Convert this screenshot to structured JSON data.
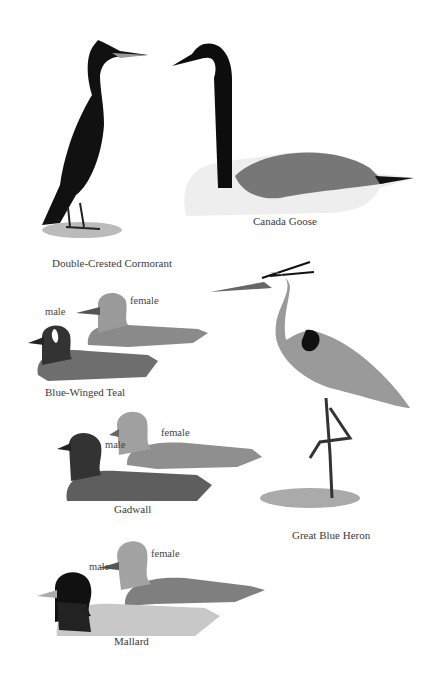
{
  "plate": {
    "birds": [
      {
        "name": "Double-Crested Cormorant"
      },
      {
        "name": "Canada Goose"
      },
      {
        "name": "Blue-Winged Teal",
        "sex_labels": [
          "male",
          "female"
        ]
      },
      {
        "name": "Gadwall",
        "sex_labels": [
          "male",
          "female"
        ]
      },
      {
        "name": "Great Blue Heron"
      },
      {
        "name": "Mallard",
        "sex_labels": [
          "male",
          "female"
        ]
      }
    ]
  }
}
